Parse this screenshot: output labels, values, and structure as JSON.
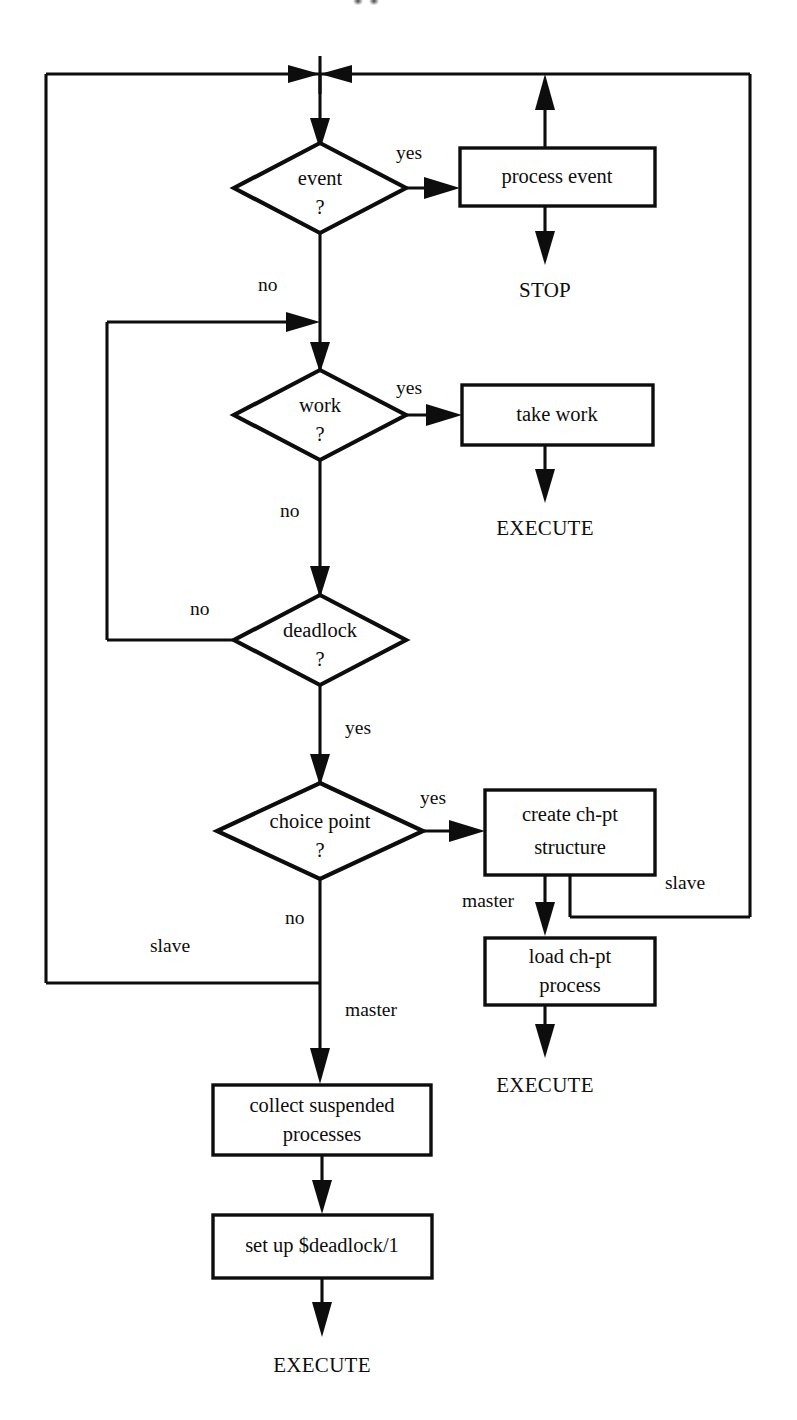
{
  "figure": {
    "type": "flowchart",
    "title": "",
    "background_color": "#ffffff",
    "line_color": "#0d0d0d",
    "artifact_top": "··"
  },
  "nodes": {
    "event": {
      "label_line1": "event",
      "label_line2": "?",
      "shape": "diamond"
    },
    "process_event": {
      "label_line1": "process event",
      "shape": "box"
    },
    "stop": {
      "label": "STOP",
      "shape": "terminal"
    },
    "work": {
      "label_line1": "work",
      "label_line2": "?",
      "shape": "diamond"
    },
    "take_work": {
      "label_line1": "take work",
      "shape": "box"
    },
    "execute_take_work": {
      "label": "EXECUTE",
      "shape": "terminal"
    },
    "deadlock": {
      "label_line1": "deadlock",
      "label_line2": "?",
      "shape": "diamond"
    },
    "choice_point": {
      "label_line1": "choice point",
      "label_line2": "?",
      "shape": "diamond"
    },
    "create_chpt": {
      "label_line1": "create ch-pt",
      "label_line2": "structure",
      "shape": "box"
    },
    "load_chpt": {
      "label_line1": "load ch-pt",
      "label_line2": "process",
      "shape": "box"
    },
    "execute_load_chpt": {
      "label": "EXECUTE",
      "shape": "terminal"
    },
    "collect_suspended": {
      "label_line1": "collect suspended",
      "label_line2": "processes",
      "shape": "box"
    },
    "set_up_deadlock": {
      "label_line1": "set up $deadlock/1",
      "shape": "box"
    },
    "execute_deadlock": {
      "label": "EXECUTE",
      "shape": "terminal"
    }
  },
  "edge_labels": {
    "event_yes": "yes",
    "event_no": "no",
    "work_yes": "yes",
    "work_no": "no",
    "deadlock_no": "no",
    "deadlock_yes": "yes",
    "choice_yes": "yes",
    "choice_no": "no",
    "chpt_master": "master",
    "chpt_slave": "slave",
    "choice_master": "master",
    "choice_slave": "slave"
  }
}
